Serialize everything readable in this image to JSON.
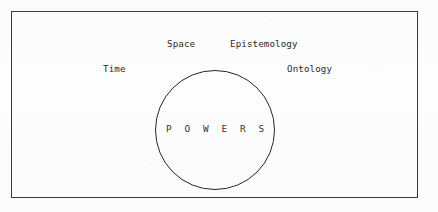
{
  "figure": {
    "type": "concept-diagram",
    "background_color": "#fdfdfd",
    "frame": {
      "name": "outer-rectangle",
      "stroke_color": "#3a3a3a",
      "x": 11,
      "y": 11,
      "width": 407,
      "height": 187
    },
    "circle": {
      "name": "powers-circle",
      "stroke_color": "#262626",
      "center_x": 215,
      "center_y": 130,
      "diameter": 120,
      "label": "P O W E R S"
    },
    "labels": [
      {
        "id": "space",
        "text": "Space",
        "x": 167,
        "y": 38
      },
      {
        "id": "epistemology",
        "text": "Epistemology",
        "x": 230,
        "y": 38
      },
      {
        "id": "time",
        "text": "Time",
        "x": 103,
        "y": 63
      },
      {
        "id": "ontology",
        "text": "Ontology",
        "x": 287,
        "y": 63
      }
    ]
  }
}
